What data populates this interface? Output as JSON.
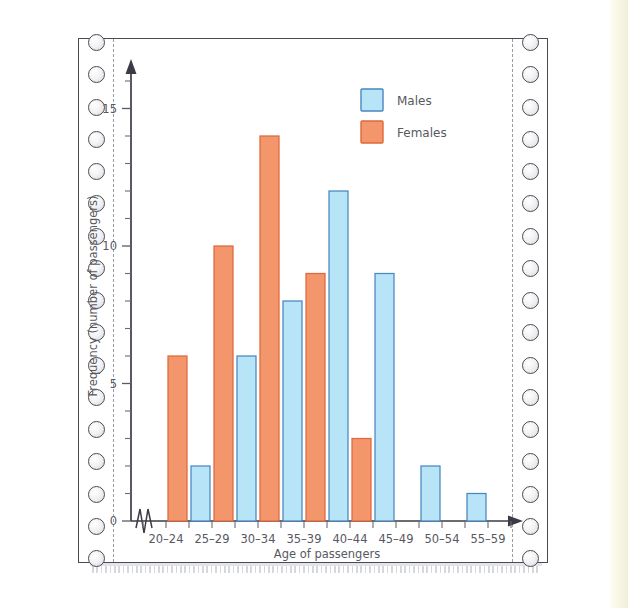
{
  "chart_data": {
    "type": "bar",
    "title": "",
    "xlabel": "Age of passengers",
    "ylabel": "Frequency (number of passengers)",
    "categories": [
      "20–24",
      "25–29",
      "30–34",
      "35–39",
      "40–44",
      "45–49",
      "50–54",
      "55–59"
    ],
    "series": [
      {
        "name": "Males",
        "color": "#b7e5f7",
        "values": [
          0,
          2,
          6,
          8,
          12,
          9,
          2,
          1
        ]
      },
      {
        "name": "Females",
        "color": "#f3966c",
        "values": [
          6,
          10,
          14,
          9,
          3,
          0,
          0,
          0
        ]
      }
    ],
    "ylim": [
      0,
      16
    ],
    "ytick_labels": [
      "0",
      "5",
      "10",
      "15"
    ],
    "ytick_values": [
      0,
      5,
      10,
      15
    ],
    "yminor_step": 1,
    "grid": false,
    "legend_position": "top-right",
    "y_axis_break": true,
    "x_axis_arrow": true,
    "y_axis_arrow": true
  },
  "axis": {
    "y_title": "Frequency (number of passengers)",
    "x_title": "Age of passengers",
    "y_labels": [
      "15",
      "10",
      "5",
      "0"
    ],
    "x_labels": [
      "20–24",
      "25–29",
      "30–34",
      "35–39",
      "40–44",
      "45–49",
      "50–54",
      "55–59"
    ]
  },
  "legend": {
    "items": [
      {
        "label": "Males",
        "swatch": "male-swatch"
      },
      {
        "label": "Females",
        "swatch": "female-swatch"
      }
    ]
  },
  "paper": {
    "type": "continuous-feed-printer-paper",
    "sprocket_holes_left": 17,
    "sprocket_holes_right": 17
  },
  "colors": {
    "male": "#b7e5f7",
    "male_stroke": "#4a86c0",
    "female": "#f3966c",
    "female_stroke": "#e0683d",
    "axis": "#3b3b45",
    "text": "#58585f",
    "paper_edge": "#f2f1de"
  }
}
